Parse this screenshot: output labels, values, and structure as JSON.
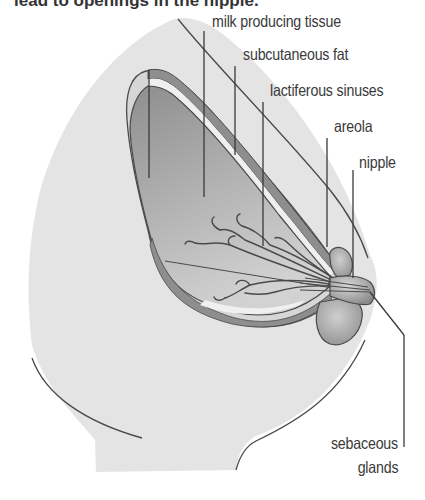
{
  "caption": "lead to openings in the nipple.",
  "labels": {
    "milk_producing_tissue": "milk  producing tissue",
    "subcutaneous_fat": "subcutaneous fat",
    "lactiferous_sinuses": "lactiferous sinuses",
    "areola": "areola",
    "nipple": "nipple",
    "sebaceous_line1": "sebaceous",
    "sebaceous_line2": "glands"
  },
  "colors": {
    "skin": "#e4e4e4",
    "outline": "#4a4a4a",
    "tissue_dark": "#9a9a9a",
    "tissue_light": "#c8c8c8",
    "fat_layer": "#ececec",
    "text": "#3a3a3a"
  }
}
